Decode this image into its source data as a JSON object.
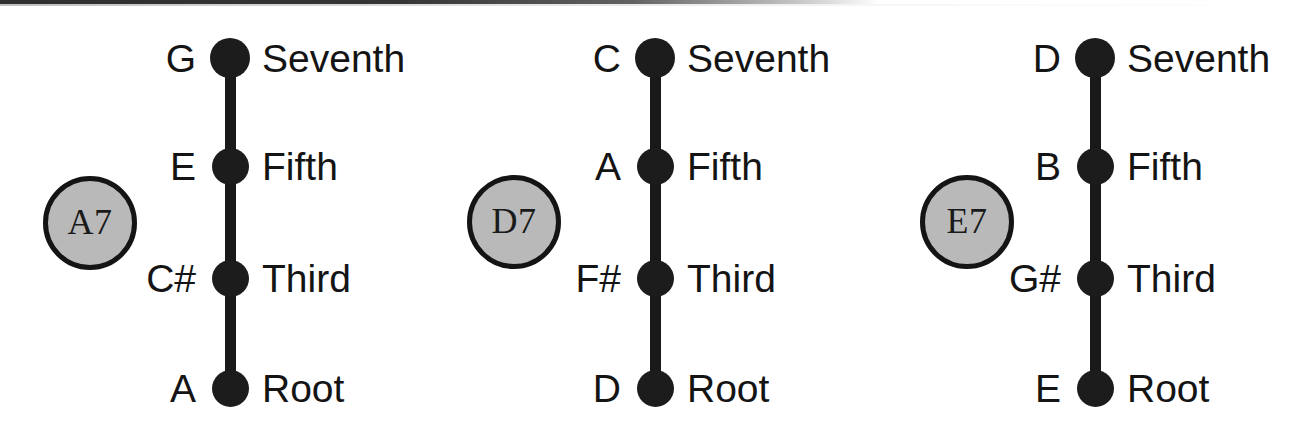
{
  "figure": {
    "background_color": "#ffffff",
    "ink_color": "#1c1c1c",
    "badge_fill_color": "#b9b9b9",
    "badge_border_color": "#141414"
  },
  "interval_labels": {
    "seventh": "Seventh",
    "fifth": "Fifth",
    "third": "Third",
    "root": "Root"
  },
  "diagrams": [
    {
      "badge": "A7",
      "stem_x": 230,
      "badge_cx": 90,
      "badge_cy": 223,
      "note_label_right": 196,
      "interval_label_left": 262,
      "tones": [
        {
          "note": "G",
          "interval": "Seventh",
          "y": 58,
          "size": "large"
        },
        {
          "note": "E",
          "interval": "Fifth",
          "y": 166,
          "size": "small"
        },
        {
          "note": "C#",
          "interval": "Third",
          "y": 278,
          "size": "small"
        },
        {
          "note": "A",
          "interval": "Root",
          "y": 388,
          "size": "small"
        }
      ]
    },
    {
      "badge": "D7",
      "stem_x": 655,
      "badge_cx": 514,
      "badge_cy": 222,
      "note_label_right": 621,
      "interval_label_left": 687,
      "tones": [
        {
          "note": "C",
          "interval": "Seventh",
          "y": 58,
          "size": "large"
        },
        {
          "note": "A",
          "interval": "Fifth",
          "y": 166,
          "size": "small"
        },
        {
          "note": "F#",
          "interval": "Third",
          "y": 278,
          "size": "small"
        },
        {
          "note": "D",
          "interval": "Root",
          "y": 388,
          "size": "small"
        }
      ]
    },
    {
      "badge": "E7",
      "stem_x": 1095,
      "badge_cx": 967,
      "badge_cy": 222,
      "note_label_right": 1061,
      "interval_label_left": 1127,
      "tones": [
        {
          "note": "D",
          "interval": "Seventh",
          "y": 58,
          "size": "large"
        },
        {
          "note": "B",
          "interval": "Fifth",
          "y": 166,
          "size": "small"
        },
        {
          "note": "G#",
          "interval": "Third",
          "y": 278,
          "size": "small"
        },
        {
          "note": "E",
          "interval": "Root",
          "y": 388,
          "size": "small"
        }
      ]
    }
  ]
}
